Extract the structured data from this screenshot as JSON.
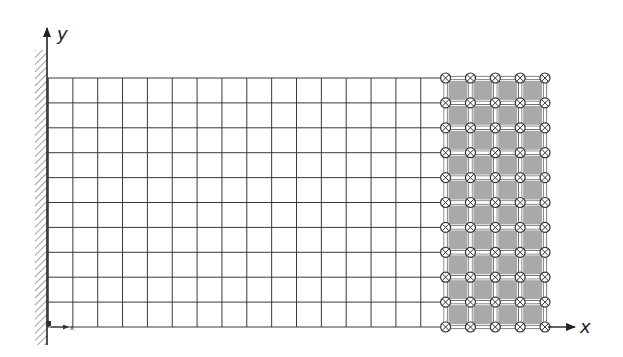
{
  "diagram": {
    "type": "finite-element-mesh",
    "axes": {
      "x_label": "x",
      "y_label": "y",
      "local_x_label": "x"
    },
    "mesh": {
      "left": 48,
      "top": 78,
      "cell_w": 24.85,
      "cell_h": 24.9,
      "cols_plain": 16,
      "cols_shaded": 4,
      "rows": 10
    },
    "boundary": {
      "type": "fixed-wall",
      "side": "left"
    },
    "shaded_region": {
      "description": "loaded region with marked nodes",
      "node_marker": "circle-cross",
      "fill": "#a9a9a9"
    },
    "colors": {
      "line": "#3a3a3a",
      "shade": "#a9a9a9",
      "node_fill": "#ffffff",
      "node_stroke": "#333333"
    }
  }
}
